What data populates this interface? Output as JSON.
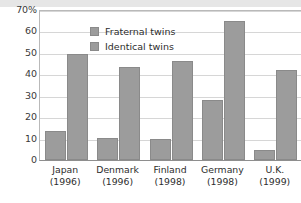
{
  "chart_data": {
    "type": "bar",
    "title": "",
    "xlabel": "",
    "ylabel": "",
    "ylim": [
      0,
      70
    ],
    "yticks": [
      "70%",
      "60",
      "50",
      "40",
      "30",
      "20",
      "10",
      "0"
    ],
    "ytick_values": [
      70,
      60,
      50,
      40,
      30,
      20,
      10,
      0
    ],
    "grid": true,
    "legend_position": "top-left",
    "categories": [
      "Japan",
      "Denmark",
      "Finland",
      "Germany",
      "U.K."
    ],
    "category_years": [
      "(1996)",
      "(1996)",
      "(1998)",
      "(1998)",
      "(1999)"
    ],
    "series": [
      {
        "name": "Fraternal twins",
        "color": "#9c9c9c",
        "values": [
          13.5,
          10.5,
          10,
          28,
          4.5
        ]
      },
      {
        "name": "Identical twins",
        "color": "#9c9c9c",
        "values": [
          49.5,
          43.5,
          46,
          65,
          42
        ]
      }
    ]
  },
  "legend": {
    "items": [
      {
        "label": "Fraternal twins",
        "color": "#9c9c9c"
      },
      {
        "label": "Identical twins",
        "color": "#9c9c9c"
      }
    ]
  },
  "axis": {
    "y_labels": [
      "70%",
      "60",
      "50",
      "40",
      "30",
      "20",
      "10",
      "0"
    ],
    "x_labels": [
      {
        "name": "Japan",
        "year": "(1996)"
      },
      {
        "name": "Denmark",
        "year": "(1996)"
      },
      {
        "name": "Finland",
        "year": "(1998)"
      },
      {
        "name": "Germany",
        "year": "(1998)"
      },
      {
        "name": "U.K.",
        "year": "(1999)"
      }
    ]
  }
}
